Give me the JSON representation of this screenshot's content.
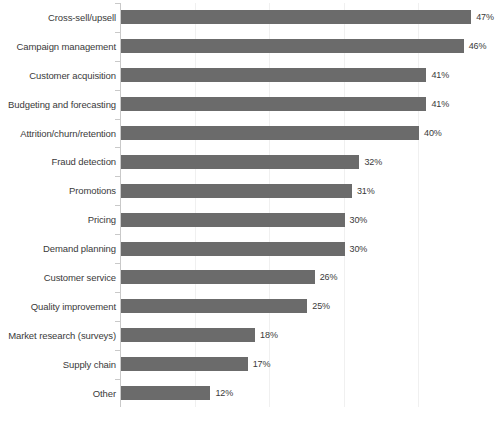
{
  "chart_data": {
    "type": "bar",
    "orientation": "horizontal",
    "title": "",
    "subtitle": "",
    "xlabel": "",
    "ylabel": "",
    "xlim": [
      0,
      50
    ],
    "grid": true,
    "legend": false,
    "value_suffix": "%",
    "bar_color": "#6b6b6b",
    "axis_color": "#c9c9c9",
    "gridline_color": "#f0f0f0",
    "text_color": "#3a3a3a",
    "gridline_values": [
      10,
      20,
      30,
      40
    ],
    "categories": [
      "Cross-sell/upsell",
      "Campaign management",
      "Customer acquisition",
      "Budgeting and forecasting",
      "Attrition/churn/retention",
      "Fraud detection",
      "Promotions",
      "Pricing",
      "Demand planning",
      "Customer service",
      "Quality improvement",
      "Market research (surveys)",
      "Supply chain",
      "Other"
    ],
    "values": [
      47,
      46,
      41,
      41,
      40,
      32,
      31,
      30,
      30,
      26,
      25,
      18,
      17,
      12
    ],
    "labels": [
      "47%",
      "46%",
      "41%",
      "41%",
      "40%",
      "32%",
      "31%",
      "30%",
      "30%",
      "26%",
      "25%",
      "18%",
      "17%",
      "12%"
    ]
  }
}
